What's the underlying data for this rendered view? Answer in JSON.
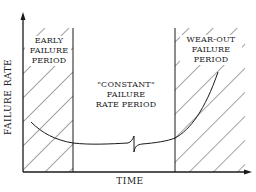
{
  "diagram": {
    "y_axis_label": "FAILURE RATE",
    "x_axis_label": "TIME",
    "regions": [
      {
        "name": "early",
        "lines": [
          "EARLY",
          "FAILURE",
          "PERIOD"
        ],
        "hatched": true
      },
      {
        "name": "constant",
        "lines": [
          "\"CONSTANT\"",
          "FAILURE",
          "RATE PERIOD"
        ],
        "hatched": false
      },
      {
        "name": "wear-out",
        "lines": [
          "WEAR-OUT",
          "FAILURE",
          "PERIOD"
        ],
        "hatched": true
      }
    ],
    "colors": {
      "line": "#1a1a1a",
      "background": "#ffffff"
    }
  }
}
